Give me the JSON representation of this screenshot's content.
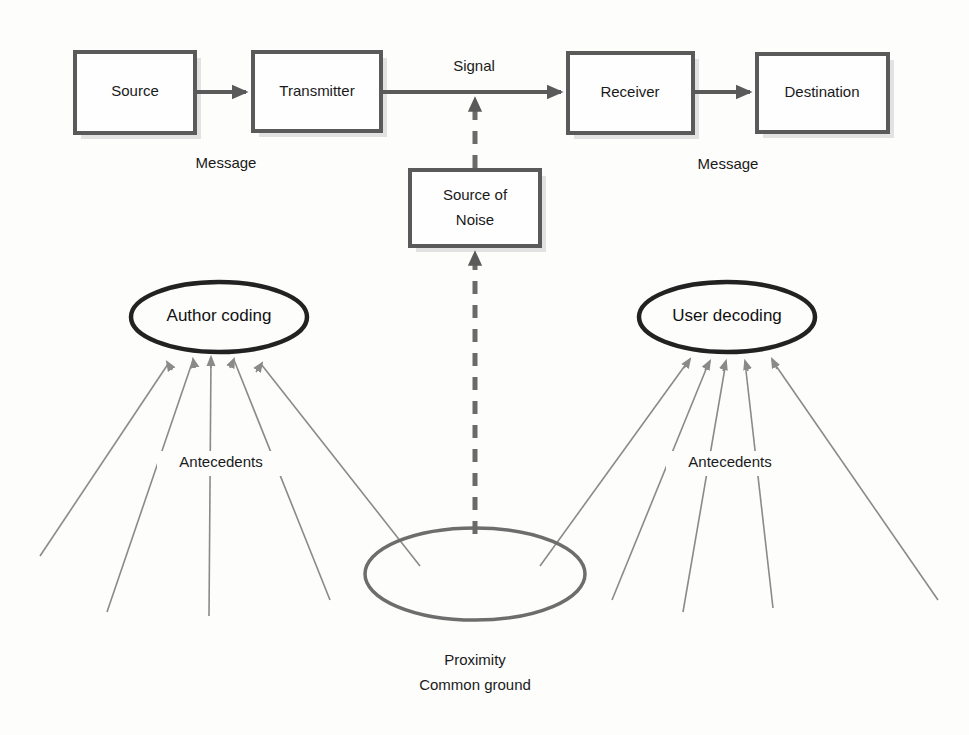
{
  "diagram": {
    "colors": {
      "box_stroke": "#5a5a5a",
      "oval_stroke": "#222222",
      "bottom_oval_stroke": "#6d6d6d",
      "thin_line": "#8a8a8a",
      "text": "#1a1a1a",
      "background": "#fdfdfc"
    },
    "boxes": [
      {
        "id": "source",
        "label": "Source",
        "x": 75,
        "y": 52,
        "w": 120,
        "h": 81
      },
      {
        "id": "transmitter",
        "label": "Transmitter",
        "x": 253,
        "y": 52,
        "w": 128,
        "h": 79
      },
      {
        "id": "receiver",
        "label": "Receiver",
        "x": 568,
        "y": 53,
        "w": 125,
        "h": 80
      },
      {
        "id": "destination",
        "label": "Destination",
        "x": 757,
        "y": 54,
        "w": 131,
        "h": 78
      },
      {
        "id": "source-of-noise",
        "label_line1": "Source of",
        "label_line2": "Noise",
        "x": 410,
        "y": 170,
        "w": 130,
        "h": 76
      }
    ],
    "ovals": [
      {
        "id": "author-coding",
        "label": "Author coding",
        "cx": 219,
        "cy": 317,
        "rx": 88,
        "ry": 35
      },
      {
        "id": "user-decoding",
        "label": "User decoding",
        "cx": 727,
        "cy": 317,
        "rx": 88,
        "ry": 35
      },
      {
        "id": "proximity-common-ground",
        "label": "",
        "cx": 475,
        "cy": 574,
        "rx": 110,
        "ry": 46
      }
    ],
    "labels": [
      {
        "id": "signal",
        "text": "Signal",
        "x": 474,
        "y": 67
      },
      {
        "id": "message-left",
        "text": "Message",
        "x": 226,
        "y": 164
      },
      {
        "id": "message-right",
        "text": "Message",
        "x": 728,
        "y": 165
      },
      {
        "id": "antecedents-left",
        "text": "Antecedents",
        "x": 221,
        "y": 463
      },
      {
        "id": "antecedents-right",
        "text": "Antecedents",
        "x": 730,
        "y": 463
      },
      {
        "id": "proximity",
        "text": "Proximity",
        "x": 475,
        "y": 661
      },
      {
        "id": "common-ground",
        "text": "Common ground",
        "x": 475,
        "y": 686
      }
    ],
    "connections": [
      {
        "id": "source-to-transmitter",
        "from": "source",
        "to": "transmitter",
        "style": "solid-arrow"
      },
      {
        "id": "transmitter-to-receiver",
        "from": "transmitter",
        "to": "receiver",
        "style": "solid-arrow",
        "label": "Signal"
      },
      {
        "id": "receiver-to-destination",
        "from": "receiver",
        "to": "destination",
        "style": "solid-arrow"
      },
      {
        "id": "noise-to-signal",
        "from": "source-of-noise",
        "to": "transmitter-to-receiver",
        "style": "dashed-arrow"
      },
      {
        "id": "common-ground-to-noise",
        "from": "proximity-common-ground",
        "to": "source-of-noise",
        "style": "dashed-arrow"
      },
      {
        "id": "antecedents-to-author-coding",
        "count": 5,
        "style": "thin-arrow",
        "to": "author-coding"
      },
      {
        "id": "antecedents-to-user-decoding",
        "count": 5,
        "style": "thin-arrow",
        "to": "user-decoding"
      }
    ]
  }
}
